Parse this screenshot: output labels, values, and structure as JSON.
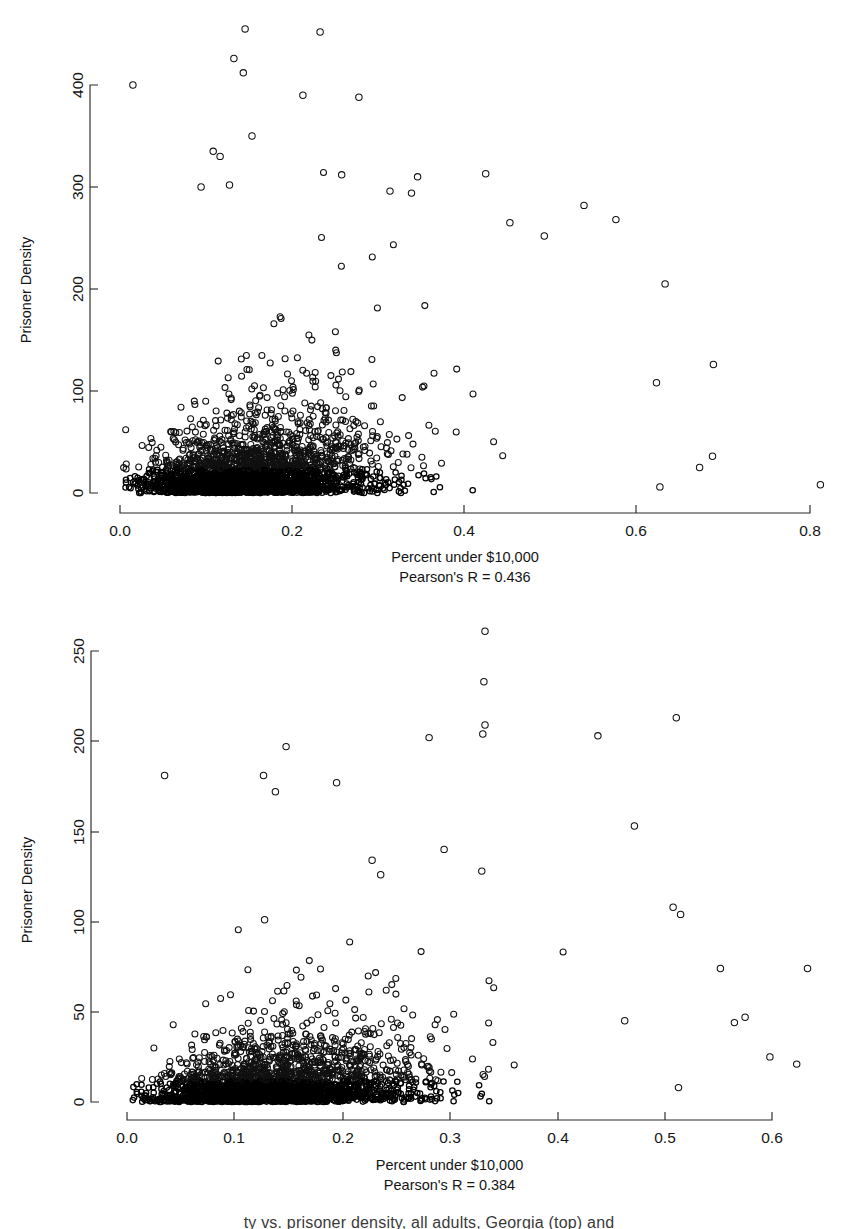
{
  "figure": {
    "background": "#ffffff",
    "marker_color": "#111111",
    "axis_color": "#2b2b2b",
    "caption_partial": "ty vs. prisoner density, all adults, Georgia (top) and"
  },
  "chart_data": [
    {
      "id": "top",
      "type": "scatter",
      "title": "",
      "xlabel": "Percent under $10,000",
      "ylabel": "Prisoner Density",
      "annotation": "Pearson's R = 0.436",
      "pearson_r": 0.436,
      "xticks": [
        0.0,
        0.2,
        0.4,
        0.6,
        0.8
      ],
      "xticklabels": [
        "0.0",
        "0.2",
        "0.4",
        "0.6",
        "0.8"
      ],
      "yticks": [
        0,
        100,
        200,
        300,
        400
      ],
      "yticklabels": [
        "0",
        "100",
        "200",
        "300",
        "400"
      ],
      "xlim": [
        0.0,
        0.82
      ],
      "ylim": [
        0,
        460
      ],
      "grid": false,
      "legend": "none",
      "n_points": 2600,
      "seed": 20231,
      "x_distribution": {
        "mode": 0.13,
        "spread": 0.085,
        "min": 0.003,
        "max": 0.815
      },
      "y_model": {
        "base_scale": 26,
        "slope": 240,
        "tail_power": 2.6,
        "max": 460
      },
      "notable_points": [
        {
          "x": 0.015,
          "y": 400
        },
        {
          "x": 0.145,
          "y": 455
        },
        {
          "x": 0.232,
          "y": 452
        },
        {
          "x": 0.132,
          "y": 426
        },
        {
          "x": 0.143,
          "y": 412
        },
        {
          "x": 0.212,
          "y": 390
        },
        {
          "x": 0.277,
          "y": 388
        },
        {
          "x": 0.153,
          "y": 350
        },
        {
          "x": 0.108,
          "y": 335
        },
        {
          "x": 0.116,
          "y": 330
        },
        {
          "x": 0.257,
          "y": 312
        },
        {
          "x": 0.345,
          "y": 310
        },
        {
          "x": 0.424,
          "y": 313
        },
        {
          "x": 0.094,
          "y": 300
        },
        {
          "x": 0.127,
          "y": 302
        },
        {
          "x": 0.313,
          "y": 296
        },
        {
          "x": 0.338,
          "y": 294
        },
        {
          "x": 0.538,
          "y": 282
        },
        {
          "x": 0.575,
          "y": 268
        },
        {
          "x": 0.452,
          "y": 265
        },
        {
          "x": 0.492,
          "y": 252
        },
        {
          "x": 0.632,
          "y": 205
        },
        {
          "x": 0.688,
          "y": 126
        },
        {
          "x": 0.622,
          "y": 108
        },
        {
          "x": 0.687,
          "y": 36
        },
        {
          "x": 0.672,
          "y": 25
        },
        {
          "x": 0.812,
          "y": 8
        },
        {
          "x": 0.626,
          "y": 6
        }
      ]
    },
    {
      "id": "bottom",
      "type": "scatter",
      "title": "",
      "xlabel": "Percent under $10,000",
      "ylabel": "Prisoner Density",
      "annotation": "Pearson's R = 0.384",
      "pearson_r": 0.384,
      "xticks": [
        0.0,
        0.1,
        0.2,
        0.3,
        0.4,
        0.5,
        0.6
      ],
      "xticklabels": [
        "0.0",
        "0.1",
        "0.2",
        "0.3",
        "0.4",
        "0.5",
        "0.6"
      ],
      "yticks": [
        0,
        50,
        100,
        150,
        200,
        250
      ],
      "yticklabels": [
        "0",
        "50",
        "100",
        "150",
        "200",
        "250"
      ],
      "xlim": [
        0.0,
        0.64
      ],
      "ylim": [
        0,
        265
      ],
      "grid": false,
      "legend": "none",
      "n_points": 2600,
      "seed": 77412,
      "x_distribution": {
        "mode": 0.115,
        "spread": 0.075,
        "min": 0.003,
        "max": 0.635
      },
      "y_model": {
        "base_scale": 13,
        "slope": 125,
        "tail_power": 2.6,
        "max": 265
      },
      "notable_points": [
        {
          "x": 0.333,
          "y": 261
        },
        {
          "x": 0.332,
          "y": 233
        },
        {
          "x": 0.511,
          "y": 213
        },
        {
          "x": 0.438,
          "y": 203
        },
        {
          "x": 0.333,
          "y": 209
        },
        {
          "x": 0.281,
          "y": 202
        },
        {
          "x": 0.331,
          "y": 204
        },
        {
          "x": 0.148,
          "y": 197
        },
        {
          "x": 0.035,
          "y": 181
        },
        {
          "x": 0.127,
          "y": 181
        },
        {
          "x": 0.138,
          "y": 172
        },
        {
          "x": 0.195,
          "y": 177
        },
        {
          "x": 0.472,
          "y": 153
        },
        {
          "x": 0.295,
          "y": 140
        },
        {
          "x": 0.228,
          "y": 134
        },
        {
          "x": 0.236,
          "y": 126
        },
        {
          "x": 0.33,
          "y": 128
        },
        {
          "x": 0.508,
          "y": 108
        },
        {
          "x": 0.515,
          "y": 104
        },
        {
          "x": 0.128,
          "y": 101
        },
        {
          "x": 0.552,
          "y": 74
        },
        {
          "x": 0.633,
          "y": 74
        },
        {
          "x": 0.575,
          "y": 47
        },
        {
          "x": 0.565,
          "y": 44
        },
        {
          "x": 0.463,
          "y": 45
        },
        {
          "x": 0.598,
          "y": 25
        },
        {
          "x": 0.623,
          "y": 21
        },
        {
          "x": 0.513,
          "y": 8
        }
      ]
    }
  ],
  "panels": {
    "top": {
      "geometry": {
        "width": 858,
        "height": 600,
        "plot_left": 122,
        "plot_right": 840,
        "plot_top": 2,
        "plot_bottom": 505,
        "axis_x_y": 513,
        "axis_y_x": 90,
        "y_tick_px": [
          493,
          391,
          289,
          187,
          85
        ],
        "x_tick_px": [
          120,
          292,
          464,
          636,
          810
        ],
        "xlabel_y": 562,
        "annot_y": 582,
        "ylabel_cx": 31,
        "ylabel_cy": 290
      }
    },
    "bottom": {
      "geometry": {
        "width": 858,
        "height": 614,
        "plot_left": 128,
        "plot_right": 845,
        "plot_top": 8,
        "plot_bottom": 512,
        "axis_x_y": 520,
        "axis_y_x": 91,
        "y_tick_px": [
          502,
          412,
          322,
          232,
          141,
          51
        ],
        "x_tick_px": [
          127,
          234,
          343,
          450,
          558,
          665,
          772
        ],
        "xlabel_y": 570,
        "annot_y": 590,
        "ylabel_cx": 32,
        "ylabel_cy": 290
      }
    }
  }
}
